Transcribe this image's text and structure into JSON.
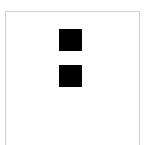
{
  "canvas": {
    "width": 146,
    "height": 145,
    "background_color": "#ffffff"
  },
  "panel": {
    "name": "bordered-panel",
    "border_color": "#d0d0d0",
    "border_width": 1,
    "background_color": "#ffffff",
    "left": 5,
    "top": 11,
    "width": 135,
    "bottom_edge_visible": false
  },
  "figure": {
    "semantic_name": "two-square-glyph",
    "fill_color": "#000000",
    "square_count": 2,
    "square_width": 23,
    "square_height": 22,
    "gap": 14,
    "group_left": 59,
    "group_top": 29,
    "squares": [
      {
        "label": "top-square",
        "left": 59,
        "top": 29,
        "width": 23,
        "height": 22
      },
      {
        "label": "bottom-square",
        "left": 59,
        "top": 65,
        "width": 23,
        "height": 22
      }
    ]
  },
  "text": {
    "has_text": false,
    "labels": []
  }
}
